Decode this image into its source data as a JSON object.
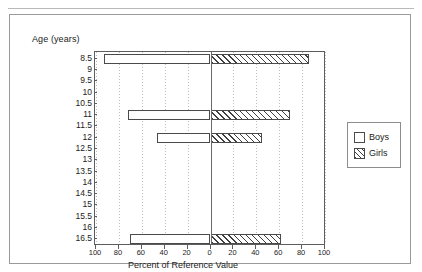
{
  "figure": {
    "y_axis_title": "Age (years)",
    "x_axis_title": "Percent of Reference Value"
  },
  "legend": {
    "items": [
      {
        "label": "Boys",
        "swatch": "empty-square-icon"
      },
      {
        "label": "Girls",
        "swatch": "hatched-square-icon"
      }
    ]
  },
  "chart_data": {
    "type": "bar",
    "orientation": "horizontal-diverging",
    "title": "",
    "xlabel": "Percent of Reference Value",
    "ylabel": "Age (years)",
    "categories": [
      "8.5",
      "9",
      "9.5",
      "10",
      "10.5",
      "11",
      "11.5",
      "12",
      "12.5",
      "13",
      "13.5",
      "14",
      "14.5",
      "15",
      "15.5",
      "16",
      "16.5"
    ],
    "xtick_labels": [
      "100",
      "80",
      "60",
      "40",
      "20",
      "0",
      "20",
      "40",
      "60",
      "80",
      "100"
    ],
    "xtick_values": [
      -100,
      -80,
      -60,
      -40,
      -20,
      0,
      20,
      40,
      60,
      80,
      100
    ],
    "xlim": [
      -100,
      100
    ],
    "grid": "vertical-dotted",
    "legend_position": "right",
    "series": [
      {
        "name": "Boys",
        "fill": "empty",
        "direction": "left",
        "values": [
          93,
          0,
          0,
          0,
          0,
          72,
          0,
          47,
          0,
          0,
          0,
          0,
          0,
          0,
          0,
          0,
          70
        ]
      },
      {
        "name": "Girls",
        "fill": "hatched",
        "direction": "right",
        "values": [
          86,
          0,
          0,
          0,
          0,
          69,
          0,
          45,
          0,
          0,
          0,
          0,
          0,
          0,
          0,
          0,
          62
        ]
      }
    ]
  }
}
